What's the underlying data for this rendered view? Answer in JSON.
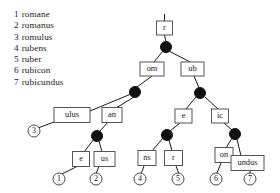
{
  "word_list": {
    "title": "",
    "items": [
      {
        "num": "1",
        "word": "romane"
      },
      {
        "num": "2",
        "word": "romanus"
      },
      {
        "num": "3",
        "word": "romulus"
      },
      {
        "num": "4",
        "word": "rubens"
      },
      {
        "num": "5",
        "word": "ruber"
      },
      {
        "num": "6",
        "word": "rubicon"
      },
      {
        "num": "7",
        "word": "rubicundus"
      }
    ]
  },
  "tree": {
    "colors": {
      "edge": "#1a1a1a",
      "node_fill": "#111111",
      "box_stroke": "#555555",
      "box_fill": "#ffffff",
      "leaf_stroke": "#4a4a4a",
      "text": "#1a1a1a",
      "background": "#ffffff"
    },
    "edge_labels": [
      {
        "id": "root",
        "label": "r",
        "x": 164.5,
        "y": 28,
        "w": 16,
        "h": 14
      },
      {
        "id": "om",
        "label": "om",
        "x": 152,
        "y": 69,
        "w": 24,
        "h": 14
      },
      {
        "id": "ub",
        "label": "ub",
        "x": 192.5,
        "y": 69,
        "w": 23,
        "h": 14
      },
      {
        "id": "ulus",
        "label": "ulus",
        "x": 72,
        "y": 115,
        "w": 36,
        "h": 15
      },
      {
        "id": "an",
        "label": "an",
        "x": 112,
        "y": 115,
        "w": 20,
        "h": 15
      },
      {
        "id": "e2",
        "label": "e",
        "x": 183.5,
        "y": 116,
        "w": 17,
        "h": 14
      },
      {
        "id": "ic",
        "label": "ic",
        "x": 220,
        "y": 116,
        "w": 17,
        "h": 14
      },
      {
        "id": "e1",
        "label": "e",
        "x": 81,
        "y": 159,
        "w": 17,
        "h": 15
      },
      {
        "id": "us",
        "label": "us",
        "x": 104.5,
        "y": 159,
        "w": 21,
        "h": 15
      },
      {
        "id": "ns",
        "label": "ns",
        "x": 147,
        "y": 158,
        "w": 18,
        "h": 15
      },
      {
        "id": "r2",
        "label": "r",
        "x": 173.5,
        "y": 158,
        "w": 18,
        "h": 15
      },
      {
        "id": "on",
        "label": "on",
        "x": 224,
        "y": 155,
        "w": 18,
        "h": 15
      },
      {
        "id": "undus",
        "label": "undus",
        "x": 247.5,
        "y": 163,
        "w": 33,
        "h": 15
      }
    ],
    "branch_nodes": [
      {
        "id": "n-root",
        "x": 166,
        "y": 47,
        "r": 5.5
      },
      {
        "id": "n-om",
        "x": 135,
        "y": 92,
        "r": 5.5
      },
      {
        "id": "n-ub",
        "x": 200,
        "y": 93,
        "r": 5.5
      },
      {
        "id": "n-an",
        "x": 97,
        "y": 136,
        "r": 5.5
      },
      {
        "id": "n-e2",
        "x": 167,
        "y": 135,
        "r": 5.5
      },
      {
        "id": "n-ic",
        "x": 235,
        "y": 134,
        "r": 5.5
      }
    ],
    "leaves": [
      {
        "id": "leaf-1",
        "label": "1",
        "x": 59,
        "y": 179,
        "r": 6
      },
      {
        "id": "leaf-2",
        "label": "2",
        "x": 96,
        "y": 179,
        "r": 6
      },
      {
        "id": "leaf-3",
        "label": "3",
        "x": 34,
        "y": 131,
        "r": 6
      },
      {
        "id": "leaf-4",
        "label": "4",
        "x": 140,
        "y": 179,
        "r": 6
      },
      {
        "id": "leaf-5",
        "label": "5",
        "x": 178,
        "y": 179,
        "r": 6
      },
      {
        "id": "leaf-6",
        "label": "6",
        "x": 216,
        "y": 179,
        "r": 6
      },
      {
        "id": "leaf-7",
        "label": "7",
        "x": 250,
        "y": 179,
        "r": 6
      }
    ],
    "edges": [
      {
        "id": "e-stub",
        "x1": 164.5,
        "y1": 14,
        "x2": 164.5,
        "y2": 21
      },
      {
        "id": "e-root-node",
        "x1": 164.5,
        "y1": 35,
        "x2": 166,
        "y2": 42
      },
      {
        "id": "e-node-om",
        "x1": 163,
        "y1": 51,
        "x2": 154,
        "y2": 62
      },
      {
        "id": "e-node-ub",
        "x1": 169,
        "y1": 51,
        "x2": 190,
        "y2": 62
      },
      {
        "id": "e-om-node",
        "x1": 152,
        "y1": 76,
        "x2": 137,
        "y2": 87
      },
      {
        "id": "e-ub-node",
        "x1": 194,
        "y1": 76,
        "x2": 199,
        "y2": 88
      },
      {
        "id": "e-omnode-ulus",
        "x1": 131,
        "y1": 94,
        "x2": 90,
        "y2": 111
      },
      {
        "id": "e-omnode-an",
        "x1": 134,
        "y1": 97,
        "x2": 116,
        "y2": 108
      },
      {
        "id": "e-ulus-leaf3",
        "x1": 54,
        "y1": 122,
        "x2": 38,
        "y2": 128
      },
      {
        "id": "e-an-node",
        "x1": 108,
        "y1": 122,
        "x2": 100,
        "y2": 131
      },
      {
        "id": "e-annode-e1",
        "x1": 94,
        "y1": 139,
        "x2": 84,
        "y2": 152
      },
      {
        "id": "e-annode-us",
        "x1": 99,
        "y1": 141,
        "x2": 102,
        "y2": 152
      },
      {
        "id": "e-e1-leaf1",
        "x1": 78,
        "y1": 166,
        "x2": 62,
        "y2": 174
      },
      {
        "id": "e-us-leaf2",
        "x1": 99,
        "y1": 166,
        "x2": 96,
        "y2": 174
      },
      {
        "id": "e-ubnode-e2",
        "x1": 196,
        "y1": 97,
        "x2": 186,
        "y2": 109
      },
      {
        "id": "e-ubnode-ic",
        "x1": 205,
        "y1": 97,
        "x2": 218,
        "y2": 109
      },
      {
        "id": "e-e2-node",
        "x1": 180,
        "y1": 123,
        "x2": 170,
        "y2": 131
      },
      {
        "id": "e-ic-node",
        "x1": 224,
        "y1": 123,
        "x2": 232,
        "y2": 130
      },
      {
        "id": "e-e2node-ns",
        "x1": 163,
        "y1": 138,
        "x2": 152,
        "y2": 151
      },
      {
        "id": "e-e2node-r2",
        "x1": 169,
        "y1": 140,
        "x2": 172,
        "y2": 151
      },
      {
        "id": "e-ns-leaf4",
        "x1": 144,
        "y1": 166,
        "x2": 141,
        "y2": 174
      },
      {
        "id": "e-r2-leaf5",
        "x1": 176,
        "y1": 166,
        "x2": 179,
        "y2": 174
      },
      {
        "id": "e-icnode-on",
        "x1": 232,
        "y1": 138,
        "x2": 226,
        "y2": 148
      },
      {
        "id": "e-icnode-und",
        "x1": 237,
        "y1": 139,
        "x2": 241,
        "y2": 156
      },
      {
        "id": "e-on-leaf6",
        "x1": 221,
        "y1": 163,
        "x2": 217,
        "y2": 173
      },
      {
        "id": "e-und-leaf7",
        "x1": 250,
        "y1": 171,
        "x2": 250,
        "y2": 173
      }
    ]
  }
}
